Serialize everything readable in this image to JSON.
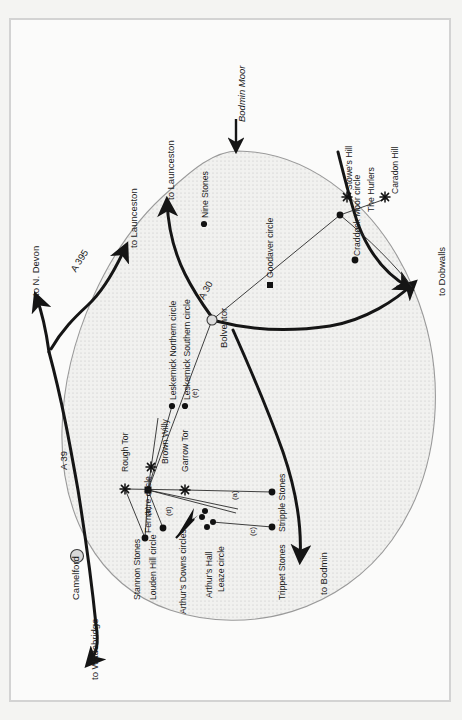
{
  "map": {
    "title": "Bodmin Moor",
    "orientation_note": "labels rotated 90 degrees (page rotated)",
    "colors": {
      "ink": "#1a1a1a",
      "road": "#151515",
      "moor_outline": "#9a9a9a",
      "moor_fill": "#f0f0ee",
      "stipple": "#b9b9b9",
      "frame": "#d3d3d3",
      "page": "#f4f4f2",
      "town_fill": "#d9d9d9"
    },
    "moor_label": {
      "text": "Bodmin Moor",
      "style": "italic"
    },
    "roads": [
      {
        "name": "A 395",
        "label": "A 395"
      },
      {
        "name": "A 39",
        "label": "A 39"
      },
      {
        "name": "A 30",
        "label": "A 30"
      }
    ],
    "destinations": [
      {
        "label": "to N. Devon"
      },
      {
        "label": "to Launceston"
      },
      {
        "label": "to Launceston"
      },
      {
        "label": "to Dobwalls"
      },
      {
        "label": "to Bodmin"
      },
      {
        "label": "to Wadebridge"
      }
    ],
    "towns": [
      {
        "label": "Camelford",
        "marker": "circle-filled-grey"
      },
      {
        "label": "Bolventor",
        "marker": "circle-filled-grey"
      }
    ],
    "tors": [
      {
        "label": "Rough Tor",
        "marker": "star"
      },
      {
        "label": "Brown Willy",
        "marker": "star"
      },
      {
        "label": "Garrow Tor",
        "marker": "star"
      },
      {
        "label": "Stowe's Hill",
        "marker": "star"
      },
      {
        "label": "Caradon Hill",
        "marker": "star"
      }
    ],
    "sites": [
      {
        "label": "Nine Stones",
        "marker": "dot"
      },
      {
        "label": "Leskernick Northern circle",
        "marker": "dot"
      },
      {
        "label": "Leskernick Southern circle",
        "marker": "dot"
      },
      {
        "label": "Goodaver circle",
        "marker": "square"
      },
      {
        "label": "Craddock Moor circle",
        "marker": "dot"
      },
      {
        "label": "The Hurlers",
        "marker": "dot"
      },
      {
        "label": "Fernacre circle",
        "marker": "square"
      },
      {
        "label": "Stannon Stones",
        "marker": "dot"
      },
      {
        "label": "Louden Hill circle",
        "marker": "dot"
      },
      {
        "label": "Arthur's Downs circles",
        "marker": "dot"
      },
      {
        "label": "Arthur's Hall",
        "marker": "dot"
      },
      {
        "label": "Leaze circle",
        "marker": "dot"
      },
      {
        "label": "Stripple Stones",
        "marker": "dot"
      },
      {
        "label": "Trippet Stones",
        "marker": "dot"
      }
    ],
    "sightlines": [
      {
        "label": "(a)"
      },
      {
        "label": "(b)"
      },
      {
        "label": "(c)"
      },
      {
        "label": "(d)"
      },
      {
        "label": "(e)"
      }
    ]
  }
}
